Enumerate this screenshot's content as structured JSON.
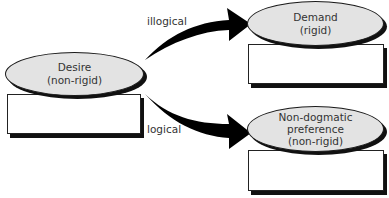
{
  "diagram": {
    "nodes": {
      "desire": {
        "line1": "Desire",
        "line2": "(non-rigid)"
      },
      "demand": {
        "line1": "Demand",
        "line2": "(rigid)"
      },
      "preference": {
        "line1": "Non-dogmatic",
        "line2": "preference",
        "line3": "(non-rigid)"
      }
    },
    "edges": {
      "illogical": {
        "label": "illogical",
        "from": "desire",
        "to": "demand"
      },
      "logical": {
        "label": "logical",
        "from": "desire",
        "to": "preference"
      }
    },
    "colors": {
      "ellipse_fill": "#e3e3e3",
      "stroke": "#1a1a1a",
      "arrow": "#000000",
      "box_fill": "#ffffff"
    }
  }
}
